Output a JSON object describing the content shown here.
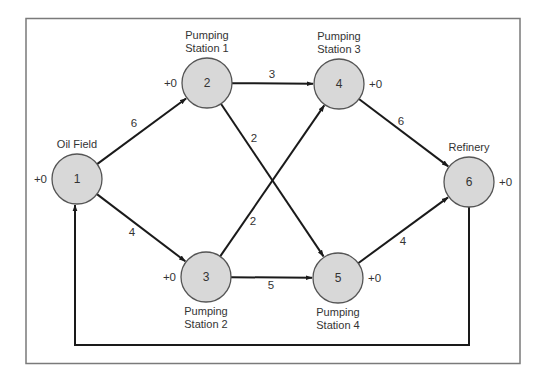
{
  "diagram": {
    "type": "flow-network",
    "nodes": [
      {
        "id": "1",
        "label_lines": [
          "Oil Field"
        ],
        "offset": "+0",
        "cx": 77,
        "cy": 179,
        "label_pos": "above",
        "offset_side": "left"
      },
      {
        "id": "2",
        "label_lines": [
          "Pumping",
          "Station 1"
        ],
        "offset": "+0",
        "cx": 207,
        "cy": 83,
        "label_pos": "above",
        "offset_side": "left"
      },
      {
        "id": "3",
        "label_lines": [
          "Pumping",
          "Station 2"
        ],
        "offset": "+0",
        "cx": 206,
        "cy": 277,
        "label_pos": "below",
        "offset_side": "left"
      },
      {
        "id": "4",
        "label_lines": [
          "Pumping",
          "Station 3"
        ],
        "offset": "+0",
        "cx": 339,
        "cy": 84,
        "label_pos": "above",
        "offset_side": "right"
      },
      {
        "id": "5",
        "label_lines": [
          "Pumping",
          "Station 4"
        ],
        "offset": "+0",
        "cx": 338,
        "cy": 278,
        "label_pos": "below",
        "offset_side": "right"
      },
      {
        "id": "6",
        "label_lines": [
          "Refinery"
        ],
        "offset": "+0",
        "cx": 469,
        "cy": 182,
        "label_pos": "above",
        "offset_side": "right"
      }
    ],
    "edges": [
      {
        "from": "1",
        "to": "2",
        "weight": "6",
        "lx": 134,
        "ly": 124
      },
      {
        "from": "1",
        "to": "3",
        "weight": "4",
        "lx": 132,
        "ly": 233
      },
      {
        "from": "2",
        "to": "4",
        "weight": "3",
        "lx": 272,
        "ly": 75
      },
      {
        "from": "2",
        "to": "5",
        "weight": "2",
        "lx": 254,
        "ly": 139
      },
      {
        "from": "3",
        "to": "4",
        "weight": "2",
        "lx": 253,
        "ly": 222
      },
      {
        "from": "3",
        "to": "5",
        "weight": "5",
        "lx": 271,
        "ly": 286
      },
      {
        "from": "4",
        "to": "6",
        "weight": "6",
        "lx": 401,
        "ly": 122
      },
      {
        "from": "5",
        "to": "6",
        "weight": "4",
        "lx": 403,
        "ly": 242
      },
      {
        "from": "6",
        "to": "1",
        "weight": "",
        "route": "return-loop"
      }
    ],
    "colors": {
      "node_fill": "#d8d8d8",
      "node_stroke": "#555555",
      "edge": "#1a1a1a",
      "frame": "#7a7a7a",
      "text": "#333333"
    }
  }
}
